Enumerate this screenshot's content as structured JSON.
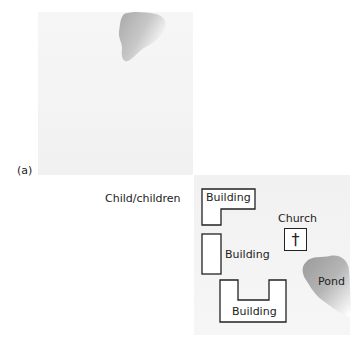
{
  "figure": {
    "panel_label": "(a)",
    "legend_label": "Child/children",
    "map": {
      "buildings": [
        {
          "label": "Building",
          "shape": "L"
        },
        {
          "label": "Building",
          "shape": "rect"
        },
        {
          "label": "Building",
          "shape": "U"
        }
      ],
      "church": {
        "label": "Church",
        "icon": "cross-icon",
        "glyph": "†"
      },
      "pond": {
        "label": "Pond"
      }
    }
  }
}
